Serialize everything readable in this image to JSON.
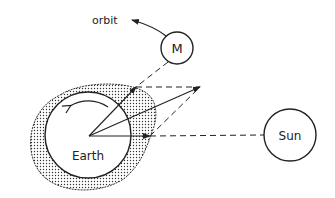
{
  "diagram": {
    "labels": {
      "orbit": "orbit",
      "moon": "M",
      "earth": "Earth",
      "sun": "Sun"
    },
    "colors": {
      "stroke": "#222222",
      "background": "#ffffff",
      "stipple": "#333333"
    }
  }
}
